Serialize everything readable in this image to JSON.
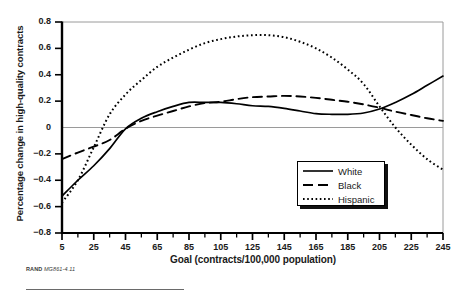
{
  "figure": {
    "source_note_prefix": "RAND",
    "source_note_id": "MG861-4.11"
  },
  "chart_data": {
    "type": "line",
    "title": "",
    "xlabel": "Goal (contracts/100,000 population)",
    "ylabel": "Percentage change in high-quality contracts",
    "xlim": [
      5,
      245
    ],
    "ylim": [
      -0.8,
      0.8
    ],
    "grid": false,
    "zero_line": true,
    "legend_position": "bottom-right",
    "xticks": [
      5,
      25,
      45,
      65,
      85,
      105,
      125,
      145,
      165,
      185,
      205,
      225,
      245
    ],
    "xtick_labels": [
      "5",
      "25",
      "45",
      "65",
      "85",
      "105",
      "125",
      "145",
      "165",
      "185",
      "205",
      "225",
      "245"
    ],
    "xminor_step": 10,
    "yticks": [
      0.8,
      0.6,
      0.4,
      0.2,
      0,
      -0.2,
      -0.4,
      -0.6,
      -0.8
    ],
    "ytick_labels": [
      "0.8",
      "0.6",
      "0.4",
      "0.2",
      "0",
      "−0.2",
      "−0.4",
      "−0.6",
      "−0.8"
    ],
    "x": [
      5,
      15,
      25,
      35,
      45,
      55,
      65,
      75,
      85,
      95,
      105,
      115,
      125,
      135,
      145,
      155,
      165,
      175,
      185,
      195,
      205,
      215,
      225,
      235,
      245
    ],
    "series": [
      {
        "name": "White",
        "style": "solid",
        "color": "#000000",
        "values": [
          -0.52,
          -0.4,
          -0.29,
          -0.16,
          -0.01,
          0.07,
          0.12,
          0.16,
          0.19,
          0.19,
          0.19,
          0.18,
          0.165,
          0.16,
          0.145,
          0.125,
          0.105,
          0.1,
          0.1,
          0.11,
          0.14,
          0.19,
          0.25,
          0.32,
          0.39
        ]
      },
      {
        "name": "Black",
        "style": "dashed",
        "color": "#000000",
        "values": [
          -0.24,
          -0.19,
          -0.145,
          -0.095,
          -0.01,
          0.05,
          0.09,
          0.125,
          0.16,
          0.185,
          0.195,
          0.215,
          0.23,
          0.235,
          0.24,
          0.235,
          0.225,
          0.21,
          0.195,
          0.175,
          0.15,
          0.12,
          0.095,
          0.07,
          0.05
        ]
      },
      {
        "name": "Hispanic",
        "style": "dotted",
        "color": "#000000",
        "values": [
          -0.57,
          -0.4,
          -0.15,
          0.1,
          0.25,
          0.36,
          0.46,
          0.53,
          0.59,
          0.64,
          0.67,
          0.69,
          0.7,
          0.7,
          0.685,
          0.65,
          0.6,
          0.53,
          0.44,
          0.33,
          0.16,
          0.0,
          -0.13,
          -0.24,
          -0.32
        ]
      }
    ]
  },
  "legend": {
    "items": [
      {
        "label": "White"
      },
      {
        "label": "Black"
      },
      {
        "label": "Hispanic"
      }
    ]
  }
}
